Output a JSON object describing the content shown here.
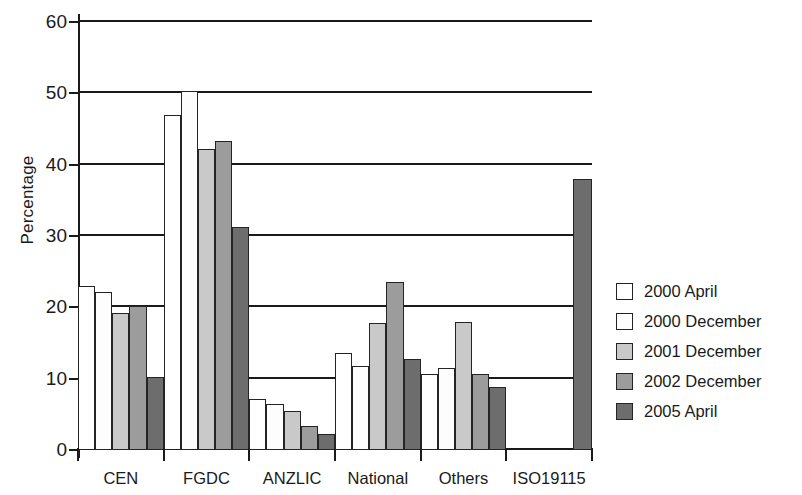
{
  "chart_data": {
    "type": "bar",
    "title": "",
    "xlabel": "",
    "ylabel": "Percentage",
    "ylim": [
      0,
      60
    ],
    "yticks": [
      0,
      10,
      20,
      30,
      40,
      50,
      60
    ],
    "grid": true,
    "legend_position": "right",
    "categories": [
      "CEN",
      "FGDC",
      "ANZLIC",
      "National",
      "Others",
      "ISO19115"
    ],
    "series": [
      {
        "name": "2000 April",
        "color": "#ffffff",
        "values": [
          23.0,
          47.0,
          7.2,
          13.6,
          10.6,
          0
        ]
      },
      {
        "name": "2000 December",
        "color": "#fdfdfd",
        "values": [
          22.2,
          50.3,
          6.5,
          11.8,
          11.5,
          0
        ]
      },
      {
        "name": "2001 December",
        "color": "#c9c9c9",
        "values": [
          19.2,
          42.2,
          5.5,
          17.8,
          17.9,
          0
        ]
      },
      {
        "name": "2002 December",
        "color": "#9c9c9c",
        "values": [
          20.2,
          43.3,
          3.3,
          23.6,
          10.6,
          0
        ]
      },
      {
        "name": "2005 April",
        "color": "#6d6d6d",
        "values": [
          10.2,
          31.3,
          2.3,
          12.7,
          8.8,
          38.0
        ]
      }
    ]
  },
  "axis": {
    "y_title": "Percentage"
  }
}
